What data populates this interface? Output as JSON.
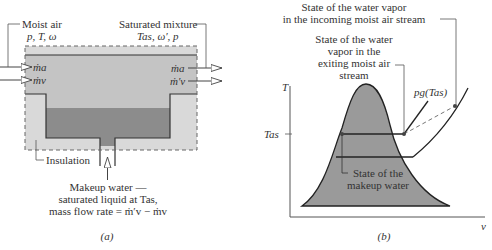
{
  "panel_a": {
    "caption": "(a)",
    "moist_air_label": "Moist air",
    "moist_air_props": "p, T, ω",
    "saturated_label": "Saturated mixture",
    "saturated_props": "Tas, ω′, p",
    "inlet_flows": [
      "ṁa",
      "ṁv"
    ],
    "outlet_flows": [
      "ṁa",
      "ṁ′v"
    ],
    "insulation_label": "Insulation",
    "makeup_line1": "Makeup water —",
    "makeup_line2": "saturated liquid at Tas,",
    "makeup_line3": "mass flow rate = ṁ′v − ṁv"
  },
  "panel_b": {
    "caption": "(b)",
    "y_axis_label": "T",
    "x_axis_label": "v",
    "tas_tick_label": "Tas",
    "incoming_line1": "State of the water vapor",
    "incoming_line2": "in the incoming moist air stream",
    "exiting_line1": "State of the water",
    "exiting_line2": "vapor in the",
    "exiting_line3": "exiting moist air",
    "exiting_line4": "stream",
    "isobar_label": "pg(Tas)",
    "makeup_line1": "State of the",
    "makeup_line2": "makeup water"
  },
  "colors": {
    "insulation_fill": "#d9d9d9",
    "air_fill": "#c4c4c4",
    "water_fill": "#8c8c8c",
    "dome_fill": "#9a9a9a",
    "line": "#333333"
  }
}
